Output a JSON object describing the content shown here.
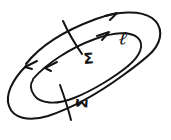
{
  "figure": {
    "background_color": "#ffffff",
    "ink_color": "#141414",
    "width": 171,
    "height": 140
  },
  "labels": {
    "sigma": "Σ",
    "sigma_tilde": "Σ̃",
    "loop": "ℓ"
  },
  "annotations": {
    "arrow_count": "4",
    "tick_count": "2",
    "loop_count": "2"
  }
}
